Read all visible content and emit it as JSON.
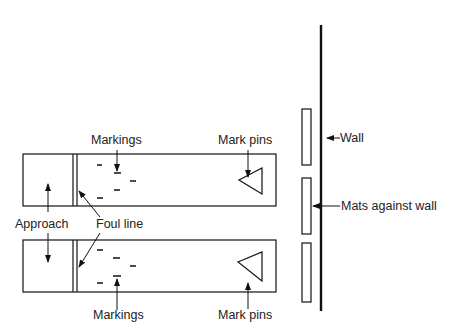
{
  "diagram": {
    "type": "bowling/lane setup diagram",
    "labels": {
      "markings_top": "Markings",
      "mark_pins_top": "Mark pins",
      "wall": "Wall",
      "mats": "Mats against wall",
      "approach": "Approach",
      "foul_line": "Foul line",
      "markings_bottom": "Markings",
      "mark_pins_bottom": "Mark pins"
    },
    "colors": {
      "line": "#111111",
      "background": "#ffffff"
    }
  }
}
